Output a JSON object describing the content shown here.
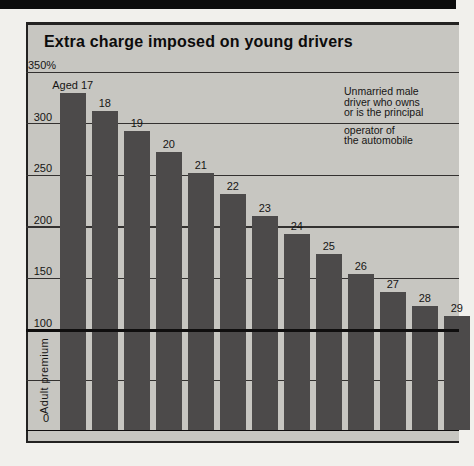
{
  "chart": {
    "title": "Extra charge imposed on young drivers",
    "y_axis": {
      "top_label": "350%",
      "tick_labels": [
        "300",
        "250",
        "200",
        "150",
        "100"
      ],
      "zero_label": "0",
      "region_label": "Adult premium"
    },
    "annotation": {
      "para1": "Unmarried male\ndriver who owns\nor is the principal",
      "para2": "operator of\nthe automobile"
    }
  },
  "chart_data": {
    "type": "bar",
    "title": "Extra charge imposed on young drivers",
    "categories": [
      "Aged 17",
      "18",
      "19",
      "20",
      "21",
      "22",
      "23",
      "24",
      "25",
      "26",
      "27",
      "28",
      "29"
    ],
    "values": [
      330,
      312,
      293,
      272,
      252,
      232,
      210,
      193,
      174,
      154,
      137,
      123,
      114
    ],
    "xlabel": "",
    "ylabel": "",
    "ylim": [
      0,
      350
    ],
    "y_max_tick_label": "350%",
    "gridline_values": [
      350,
      300,
      250,
      200,
      150,
      100,
      50,
      0
    ],
    "emphasized_gridline": 100,
    "baseline": {
      "value": 100,
      "label": "Adult premium"
    },
    "annotation": "Unmarried male driver who owns or is the principal operator of the automobile",
    "legend": false,
    "grid": true
  },
  "colors": {
    "page_bg": "#f1f0ec",
    "top_rule": "#0c0c0c",
    "panel_bg": "#c7c6c1",
    "bar": "#4c4a4a",
    "gridline": "#333130",
    "emphasis_line": "#0f0e0e",
    "border": "#232221",
    "text": "#161514"
  }
}
